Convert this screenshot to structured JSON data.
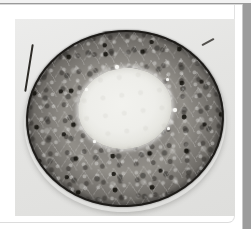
{
  "document": {
    "title": "",
    "page_background_color": "#ffffff",
    "card_background_color": "#ffffff",
    "right_gutter_color": "#9c9c9c",
    "header_rule_color": "#9a9a9a"
  },
  "figure": {
    "caption": "",
    "plate_background_color": "#e6e6e4",
    "modality": "light microscopy histological section",
    "specimen": {
      "label": "",
      "shape": "circular cross-section",
      "membrane_color": "#1d1b18",
      "cortex_color": "#8a8782",
      "nucleus_color": "#16140f",
      "lumen_color": "#eeeeea"
    },
    "artifacts": [
      {
        "name": "fiber-upper-left"
      },
      {
        "name": "fiber-upper-right"
      }
    ],
    "vacuoles": [
      {
        "name": "vacuole-1"
      },
      {
        "name": "vacuole-2"
      },
      {
        "name": "vacuole-3"
      },
      {
        "name": "vacuole-4"
      },
      {
        "name": "vacuole-5"
      },
      {
        "name": "vacuole-6"
      }
    ]
  }
}
